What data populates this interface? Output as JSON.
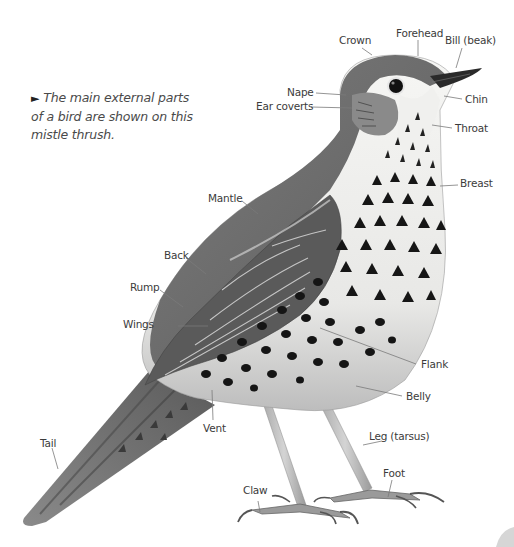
{
  "caption": {
    "marker": "►",
    "text": "The main external parts of a bird are shown on this mistle thrush."
  },
  "bird": {
    "species": "mistle thrush",
    "colors": {
      "upperparts": "#6e6e6e",
      "wing": "#5a5a5a",
      "underparts": "#f2f2f0",
      "spots": "#1a1a1a",
      "bill": "#2a2a2a",
      "legs": "#b9b9b9",
      "label_text": "#3b3b3b",
      "leader_line": "#7a7a7a"
    }
  },
  "labels": {
    "crown": "Crown",
    "forehead": "Forehead",
    "bill": "Bill (beak)",
    "nape": "Nape",
    "ear_coverts": "Ear coverts",
    "chin": "Chin",
    "throat": "Throat",
    "breast": "Breast",
    "mantle": "Mantle",
    "back": "Back",
    "rump": "Rump",
    "wings": "Wings",
    "flank": "Flank",
    "belly": "Belly",
    "vent": "Vent",
    "leg": "Leg (tarsus)",
    "tail": "Tail",
    "foot": "Foot",
    "claw": "Claw"
  }
}
